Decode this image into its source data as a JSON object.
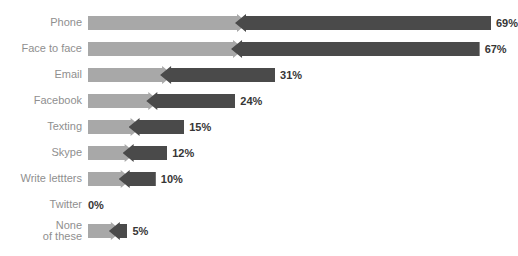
{
  "chart_data": {
    "type": "bar",
    "title": "",
    "xlabel": "",
    "ylabel": "",
    "grid": false,
    "legend": "none",
    "orientation": "horizontal",
    "value_suffix": "%",
    "xlim": [
      0,
      69
    ],
    "categories": [
      "Phone",
      "Face to face",
      "Email",
      "Facebook",
      "Texting",
      "Skype",
      "Write lettters",
      "Twitter",
      "None of these"
    ],
    "values": [
      69,
      67,
      31,
      24,
      15,
      12,
      10,
      0,
      5
    ],
    "value_labels": [
      "69%",
      "67%",
      "31%",
      "24%",
      "15%",
      "12%",
      "10%",
      "0%",
      "5%"
    ]
  },
  "colors": {
    "light_arrow": "#a8a8a8",
    "dark_arrow": "#4a4a4a",
    "label_text": "#8f8f8f",
    "value_text": "#363636",
    "background": "#ffffff"
  },
  "rows": [
    {
      "label": "Phone",
      "label_line2": "",
      "value_label": "69%"
    },
    {
      "label": "Face to face",
      "label_line2": "",
      "value_label": "67%"
    },
    {
      "label": "Email",
      "label_line2": "",
      "value_label": "31%"
    },
    {
      "label": "Facebook",
      "label_line2": "",
      "value_label": "24%"
    },
    {
      "label": "Texting",
      "label_line2": "",
      "value_label": "15%"
    },
    {
      "label": "Skype",
      "label_line2": "",
      "value_label": "12%"
    },
    {
      "label": "Write lettters",
      "label_line2": "",
      "value_label": "10%"
    },
    {
      "label": "Twitter",
      "label_line2": "",
      "value_label": "0%"
    },
    {
      "label": "None",
      "label_line2": "of these",
      "value_label": "5%"
    }
  ]
}
